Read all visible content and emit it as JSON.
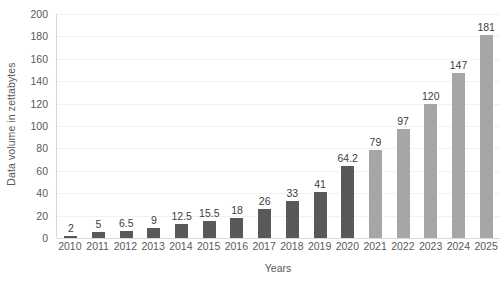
{
  "chart_data": {
    "type": "bar",
    "title": "",
    "xlabel": "Years",
    "ylabel": "Data volume in zettabytes",
    "categories": [
      "2010",
      "2011",
      "2012",
      "2013",
      "2014",
      "2015",
      "2016",
      "2017",
      "2018",
      "2019",
      "2020",
      "2021",
      "2022",
      "2023",
      "2024",
      "2025"
    ],
    "values": [
      2,
      5,
      6.5,
      9,
      12.5,
      15.5,
      18,
      26,
      33,
      41,
      64.2,
      79,
      97,
      120,
      147,
      181
    ],
    "data_labels": [
      "2",
      "5",
      "6.5",
      "9",
      "12.5",
      "15.5",
      "18",
      "26",
      "33",
      "41",
      "64.2",
      "79",
      "97",
      "120",
      "147",
      "181"
    ],
    "series": [
      {
        "name": "Data volume",
        "values": [
          2,
          5,
          6.5,
          9,
          12.5,
          15.5,
          18,
          26,
          33,
          41,
          64.2,
          79,
          97,
          120,
          147,
          181
        ]
      }
    ],
    "bar_styles": [
      "actual",
      "actual",
      "actual",
      "actual",
      "actual",
      "actual",
      "actual",
      "actual",
      "actual",
      "actual",
      "actual",
      "forecast",
      "forecast",
      "forecast",
      "forecast",
      "forecast"
    ],
    "ylim": [
      0,
      200
    ],
    "ytick_labels": [
      "200",
      "180",
      "160",
      "140",
      "120",
      "100",
      "80",
      "60",
      "40",
      "20",
      "0"
    ],
    "ytick_values": [
      200,
      180,
      160,
      140,
      120,
      100,
      80,
      60,
      40,
      20,
      0
    ],
    "grid": true,
    "legend": "none",
    "colors": {
      "bar_actual": "#595959",
      "bar_forecast": "#a6a6a6",
      "gridline": "#f2f2f2",
      "axis_line": "#d9d9d9",
      "tick_text": "#595959",
      "data_label_text": "#404040",
      "background": "#ffffff"
    }
  }
}
